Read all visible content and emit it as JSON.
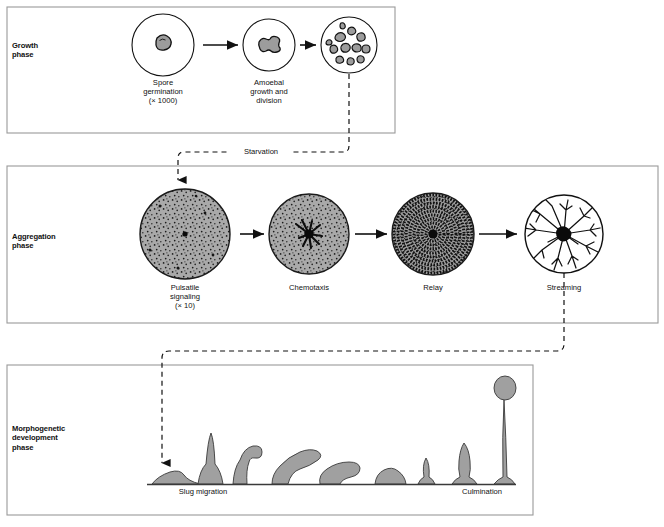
{
  "figure": {
    "background": "#ffffff",
    "panel_border_color": "#9a9a9a",
    "ink": "#111111",
    "cell_fill": "#a9a9a9",
    "cell_stroke": "#1a1a1a"
  },
  "panels": [
    {
      "id": "growth",
      "label": "Growth\nphase",
      "x": 7,
      "y": 7,
      "w": 388,
      "h": 126
    },
    {
      "id": "aggregation",
      "label": "Aggregation\nphase",
      "x": 7,
      "y": 166,
      "w": 651,
      "h": 157
    },
    {
      "id": "morphogenetic",
      "label": "Morphogenetic\ndevelopment\nphase",
      "x": 7,
      "y": 365,
      "w": 526,
      "h": 150
    }
  ],
  "growth_phase": {
    "stages": [
      {
        "name": "spore-germination",
        "caption": "Spore\ngermination\n(× 1000)",
        "cx": 163,
        "cy": 45,
        "r": 31
      },
      {
        "name": "amoebal-growth",
        "caption": "Amoebal\ngrowth and\ndivision",
        "cx": 269,
        "cy": 45,
        "r": 26
      },
      {
        "name": "amoebal-population",
        "caption": "",
        "cx": 349,
        "cy": 45,
        "r": 28
      }
    ],
    "arrows": [
      {
        "x1": 203,
        "y1": 45,
        "x2": 240,
        "y2": 45
      },
      {
        "x1": 300,
        "y1": 45,
        "x2": 318,
        "y2": 45
      }
    ]
  },
  "aggregation_phase": {
    "stages": [
      {
        "name": "pulsatile-signaling",
        "caption": "Pulsatile\nsignaling\n(× 10)",
        "cx": 185,
        "cy": 234,
        "r": 45,
        "style": "speckled"
      },
      {
        "name": "chemotaxis",
        "caption": "Chemotaxis",
        "cx": 309,
        "cy": 234,
        "r": 40,
        "style": "chemotaxis"
      },
      {
        "name": "relay",
        "caption": "Relay",
        "cx": 433,
        "cy": 234,
        "r": 41,
        "style": "relay"
      },
      {
        "name": "streaming",
        "caption": "Streaming",
        "cx": 564,
        "cy": 234,
        "r": 39,
        "style": "streaming"
      }
    ],
    "arrows": [
      {
        "x1": 240,
        "y1": 234,
        "x2": 266,
        "y2": 234
      },
      {
        "x1": 355,
        "y1": 234,
        "x2": 389,
        "y2": 234
      },
      {
        "x1": 479,
        "y1": 234,
        "x2": 519,
        "y2": 234
      }
    ]
  },
  "morphogenetic_phase": {
    "ground_line": {
      "x1": 147,
      "y1": 484,
      "x2": 516,
      "y2": 484
    },
    "captions": [
      {
        "name": "slug-migration",
        "text": "Slug migration",
        "x": 203,
        "y": 489
      },
      {
        "name": "culmination",
        "text": "Culmination",
        "x": 482,
        "y": 489
      }
    ],
    "stages": [
      "loose-mound",
      "tipped-aggregate",
      "finger",
      "tilting-slug",
      "migrating-slug",
      "mexican-hat-mound",
      "early-culminant",
      "mid-culminant",
      "fruiting-body"
    ]
  },
  "connectors": [
    {
      "name": "starvation-connector",
      "label": "Starvation",
      "from": "amoebal-population",
      "to": "pulsatile-signaling",
      "label_x": 259,
      "label_y": 152
    },
    {
      "name": "streaming-to-morphogenesis-connector",
      "label": "",
      "from": "streaming",
      "to": "morphogenetic-phase"
    }
  ]
}
